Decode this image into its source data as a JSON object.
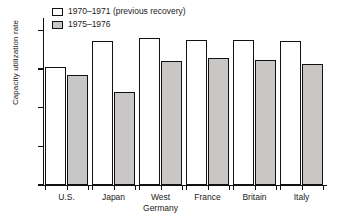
{
  "chart_data": {
    "type": "bar",
    "title": "",
    "xlabel": "",
    "ylabel": "Capacity utilization rate",
    "ylim": [
      0,
      108
    ],
    "yticks": [
      0,
      25,
      50,
      75,
      100
    ],
    "ytick_labels": [
      "0",
      "25",
      "50",
      "75",
      "100"
    ],
    "grid": false,
    "legend_position": "top-left",
    "categories": [
      "U.S.",
      "Japan",
      "West\nGermany",
      "France",
      "Britain",
      "Italy"
    ],
    "series": [
      {
        "name": "1970–1971 (previous recovery)",
        "color": "#ffffff",
        "values": [
          76,
          93,
          95,
          94,
          94,
          93
        ]
      },
      {
        "name": "1975–1976",
        "color": "#c9c6c6",
        "values": [
          71,
          60,
          80,
          82,
          81,
          78
        ]
      }
    ]
  },
  "legend": {
    "items": [
      {
        "label": "1970–1971 (previous recovery)",
        "swatch": "white-outlined-square"
      },
      {
        "label": "1975–1976",
        "swatch": "grey-filled-square"
      }
    ]
  },
  "axis": {
    "y_title": "Capacity utilization rate"
  },
  "colors": {
    "bar_prev_fill": "#ffffff",
    "bar_curr_fill": "#c9c6c6",
    "bar_outline": "#121212",
    "axis": "#111111",
    "text": "#1a1a1a",
    "background": "#ffffff"
  }
}
